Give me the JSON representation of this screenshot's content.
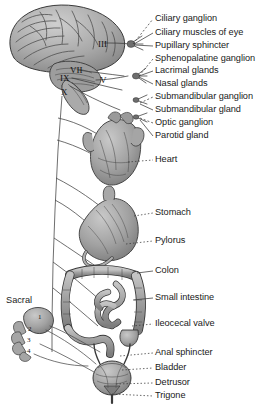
{
  "figure": {
    "background": "#ffffff",
    "ink": "#2b2b2b",
    "organ_fill": "#9a9a9a"
  },
  "cranial_nerves": [
    {
      "id": "iii",
      "numeral": "III",
      "x": 98,
      "y": 40
    },
    {
      "id": "vii",
      "numeral": "VII",
      "x": 70,
      "y": 66
    },
    {
      "id": "ix",
      "numeral": "IX",
      "x": 60,
      "y": 74
    },
    {
      "id": "x",
      "numeral": "X",
      "x": 61,
      "y": 88
    },
    {
      "id": "v",
      "numeral": "V",
      "x": 100,
      "y": 76
    }
  ],
  "sacral": {
    "label": "Sacral",
    "x": 6,
    "y": 296,
    "segments": [
      "1",
      "2",
      "3",
      "4"
    ]
  },
  "labels": [
    {
      "id": "ciliary-ganglion",
      "text": "Ciliary ganglion",
      "x": 155,
      "y": 19,
      "tip_x": 133,
      "tip_y": 44,
      "dash": "2,2"
    },
    {
      "id": "ciliary-muscles-of-eye",
      "text": "Ciliary muscles of eye",
      "x": 155,
      "y": 33,
      "tip_x": 134,
      "tip_y": 44,
      "dash": "0"
    },
    {
      "id": "pupillary-sphincter",
      "text": "Pupillary sphincter",
      "x": 155,
      "y": 46,
      "tip_x": 134,
      "tip_y": 45,
      "dash": "0"
    },
    {
      "id": "sphenopalatine-ganglion",
      "text": "Sphenopalatine ganglion",
      "x": 155,
      "y": 59,
      "tip_x": 139,
      "tip_y": 76,
      "dash": "2,2"
    },
    {
      "id": "lacrimal-glands",
      "text": "Lacrimal  glands",
      "x": 155,
      "y": 71,
      "tip_x": 139,
      "tip_y": 76,
      "dash": "0"
    },
    {
      "id": "nasal-glands",
      "text": "Nasal glands",
      "x": 155,
      "y": 84,
      "tip_x": 139,
      "tip_y": 77,
      "dash": "0"
    },
    {
      "id": "submandibular-ganglion",
      "text": "Submandibular ganglion",
      "x": 155,
      "y": 97,
      "tip_x": 140,
      "tip_y": 103,
      "dash": "2,2"
    },
    {
      "id": "submandibular-gland",
      "text": "Submandibular gland",
      "x": 155,
      "y": 110,
      "tip_x": 140,
      "tip_y": 104,
      "dash": "0"
    },
    {
      "id": "optic-ganglion",
      "text": "Optic ganglion",
      "x": 155,
      "y": 123,
      "tip_x": 140,
      "tip_y": 118,
      "dash": "2,2"
    },
    {
      "id": "parotid-gland",
      "text": "Parotid gland",
      "x": 155,
      "y": 136,
      "tip_x": 140,
      "tip_y": 120,
      "dash": "0"
    },
    {
      "id": "heart",
      "text": "Heart",
      "x": 155,
      "y": 160,
      "tip_x": 128,
      "tip_y": 162,
      "dash": "1.5,2"
    },
    {
      "id": "stomach",
      "text": "Stomach",
      "x": 155,
      "y": 213,
      "tip_x": 134,
      "tip_y": 216,
      "dash": "1.5,2"
    },
    {
      "id": "pylorus",
      "text": "Pylorus",
      "x": 155,
      "y": 241,
      "tip_x": 126,
      "tip_y": 244,
      "dash": "1.5,2"
    },
    {
      "id": "colon",
      "text": "Colon",
      "x": 155,
      "y": 271,
      "tip_x": 137,
      "tip_y": 273,
      "dash": "0"
    },
    {
      "id": "small-intestine",
      "text": "Small intestine",
      "x": 155,
      "y": 298,
      "tip_x": 133,
      "tip_y": 300,
      "dash": "0"
    },
    {
      "id": "ileocecal-valve",
      "text": "Ileocecal  valve",
      "x": 155,
      "y": 324,
      "tip_x": 132,
      "tip_y": 326,
      "dash": "1.5,2"
    },
    {
      "id": "anal-sphincter",
      "text": "Anal sphincter",
      "x": 155,
      "y": 353,
      "tip_x": 120,
      "tip_y": 356,
      "dash": "1.5,2"
    },
    {
      "id": "bladder",
      "text": "Bladder",
      "x": 155,
      "y": 368,
      "tip_x": 122,
      "tip_y": 370,
      "dash": "1.5,2"
    },
    {
      "id": "detrusor",
      "text": "Detrusor",
      "x": 155,
      "y": 383,
      "tip_x": 116,
      "tip_y": 384,
      "dash": "1.5,2"
    },
    {
      "id": "trigone",
      "text": "Trigone",
      "x": 155,
      "y": 396,
      "tip_x": 112,
      "tip_y": 394,
      "dash": "1.5,2"
    }
  ],
  "organs": [
    {
      "id": "brain",
      "name": "brain"
    },
    {
      "id": "heart",
      "name": "heart"
    },
    {
      "id": "stomach",
      "name": "stomach"
    },
    {
      "id": "colon",
      "name": "colon"
    },
    {
      "id": "small-intestine",
      "name": "small-intestine"
    },
    {
      "id": "rectum",
      "name": "rectum"
    },
    {
      "id": "bladder",
      "name": "bladder"
    },
    {
      "id": "sacrum",
      "name": "sacrum"
    }
  ]
}
